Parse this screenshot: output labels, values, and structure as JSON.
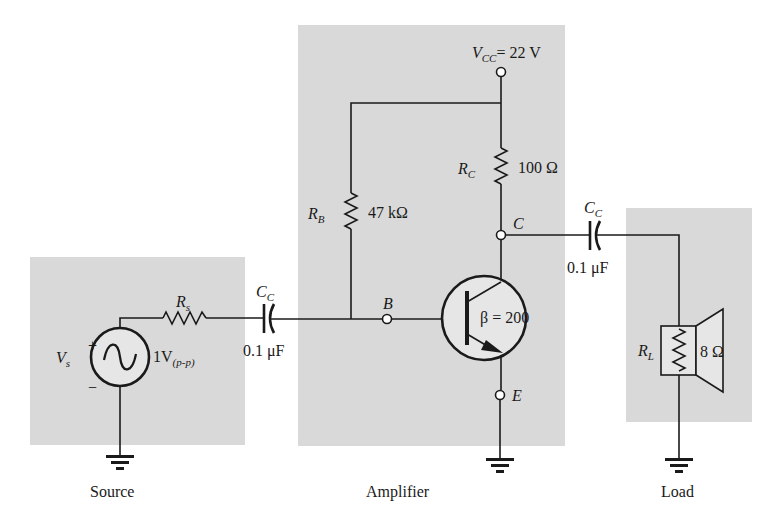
{
  "figure": {
    "sections": {
      "source": {
        "caption": "Source"
      },
      "amplifier": {
        "caption": "Amplifier"
      },
      "load": {
        "caption": "Load"
      }
    }
  },
  "components": {
    "vs": {
      "symbol": "V",
      "sub": "s",
      "value_main": "1V",
      "value_sub": "(p-p)",
      "plus": "+",
      "minus": "−"
    },
    "rs": {
      "symbol": "R",
      "sub": "s"
    },
    "cc_in": {
      "symbol": "C",
      "sub": "C",
      "value": "0.1 μF"
    },
    "rb": {
      "symbol": "R",
      "sub": "B",
      "value": "47 kΩ"
    },
    "rc": {
      "symbol": "R",
      "sub": "C",
      "value": "100 Ω"
    },
    "vcc": {
      "symbol": "V",
      "sub": "CC",
      "value": "= 22 V"
    },
    "transistor": {
      "beta": "β = 200"
    },
    "cc_out": {
      "symbol": "C",
      "sub": "C",
      "value": "0.1 μF"
    },
    "rl": {
      "symbol": "R",
      "sub": "L",
      "value": "8 Ω"
    }
  },
  "nodes": {
    "base": "B",
    "collector": "C",
    "emitter": "E"
  },
  "colors": {
    "panel": "#d9d9d9",
    "line": "#1a1a1a",
    "background": "#ffffff"
  }
}
